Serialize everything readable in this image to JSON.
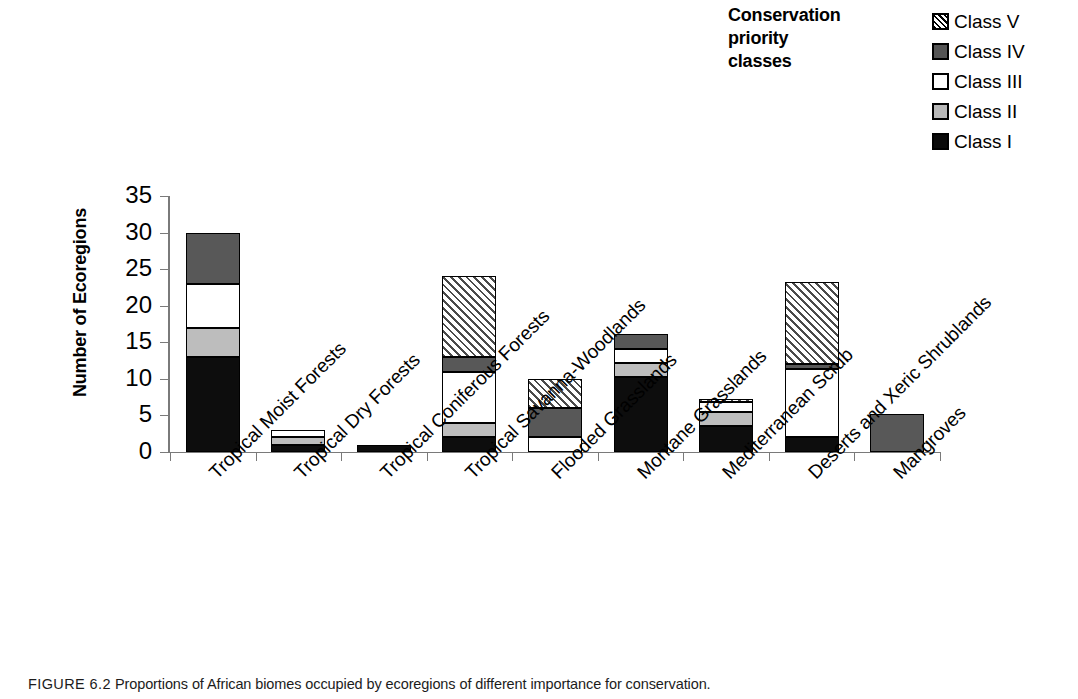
{
  "legend": {
    "title": "Conservation priority classes",
    "title_lines": [
      "Conservation",
      "priority",
      "classes"
    ],
    "items": [
      {
        "label": "Class V",
        "swatch": "hatched-diagonal",
        "color": "#ffffff"
      },
      {
        "label": "Class IV",
        "swatch": "solid-dark-gray",
        "color": "#585858"
      },
      {
        "label": "Class III",
        "swatch": "solid-white",
        "color": "#ffffff"
      },
      {
        "label": "Class II",
        "swatch": "solid-light-gray",
        "color": "#bdbdbd"
      },
      {
        "label": "Class I",
        "swatch": "solid-black",
        "color": "#0d0d0d"
      }
    ]
  },
  "axes": {
    "ylabel": "Number of Ecoregions",
    "yticks": [
      "0",
      "5",
      "10",
      "15",
      "20",
      "25",
      "30",
      "35"
    ],
    "ymin": 0,
    "ymax": 35
  },
  "caption": {
    "figure_number": "FIGURE 6.2",
    "text": "Proportions of African biomes occupied by ecoregions of different importance for conservation."
  },
  "chart_data": {
    "type": "bar",
    "stacked": true,
    "title": "",
    "xlabel": "",
    "ylabel": "Number of Ecoregions",
    "ylim": [
      0,
      35
    ],
    "yticks": [
      0,
      5,
      10,
      15,
      20,
      25,
      30,
      35
    ],
    "grid": false,
    "legend_position": "top-right",
    "legend_title": "Conservation priority classes",
    "categories": [
      "Tropical Moist Forests",
      "Tropical Dry Forests",
      "Tropical Coniferous Forests",
      "Tropical Savanna-Woodlands",
      "Flooded Grasslands",
      "Montane Grasslands",
      "Mediterranean Scrub",
      "Deserts and Xeric Shrublands",
      "Mangroves"
    ],
    "series": [
      {
        "name": "Class I",
        "values": [
          13,
          1,
          1,
          2,
          0,
          10.3,
          3.5,
          2,
          0
        ]
      },
      {
        "name": "Class II",
        "values": [
          4,
          1,
          0,
          2,
          0,
          1.8,
          2,
          0,
          0
        ]
      },
      {
        "name": "Class III",
        "values": [
          6,
          1,
          0,
          7,
          2,
          2,
          1.3,
          9.3,
          0
        ]
      },
      {
        "name": "Class IV",
        "values": [
          7,
          0,
          0,
          2,
          4,
          2.1,
          0,
          0.7,
          5.2
        ]
      },
      {
        "name": "Class V",
        "values": [
          0,
          0,
          0,
          11,
          4,
          0,
          0.5,
          11.2,
          0
        ]
      }
    ],
    "totals": [
      30,
      3,
      1,
      24,
      10,
      16.2,
      7.3,
      23.2,
      5.2
    ]
  }
}
